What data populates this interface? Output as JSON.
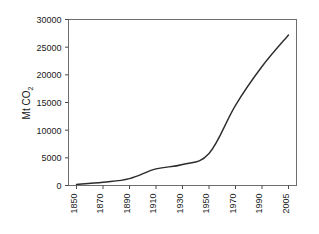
{
  "chart_data": {
    "type": "line",
    "title": "",
    "subtitle": "",
    "xlabel": "",
    "ylabel": "Mt CO2",
    "ylabel_parts": {
      "main": "Mt CO",
      "subscript": "2"
    },
    "x": [
      1850,
      1870,
      1890,
      1910,
      1930,
      1950,
      1970,
      1990,
      2005
    ],
    "values": [
      200,
      600,
      1250,
      3000,
      3800,
      5800,
      14500,
      21500,
      27200
    ],
    "series": [
      {
        "name": "Global CO2 emissions",
        "values": [
          200,
          600,
          1250,
          3000,
          3800,
          5800,
          14500,
          21500,
          27200
        ]
      }
    ],
    "xtick_labels": [
      "1850",
      "1870",
      "1890",
      "1910",
      "1930",
      "1950",
      "1970",
      "1990",
      "2005"
    ],
    "ytick_labels": [
      "0",
      "5000",
      "10000",
      "15000",
      "20000",
      "25000",
      "30000"
    ],
    "ytick_values": [
      0,
      5000,
      10000,
      15000,
      20000,
      25000,
      30000
    ],
    "ylim": [
      0,
      30000
    ],
    "grid": "horizontal-dotted",
    "legend": "none",
    "line_color": "#2b2b2b",
    "grid_color": "#c9c9c9",
    "frame_color": "#6e6e6e",
    "background_color": "#ffffff",
    "xtick_label_rotation": -90
  }
}
